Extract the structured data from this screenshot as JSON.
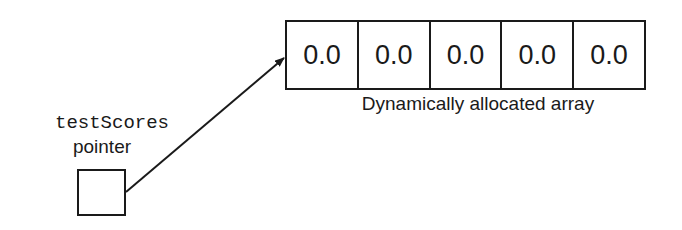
{
  "diagram": {
    "array": {
      "cells": [
        "0.0",
        "0.0",
        "0.0",
        "0.0",
        "0.0"
      ],
      "caption": "Dynamically allocated array"
    },
    "pointer": {
      "variable_name": "testScores",
      "label": "pointer"
    },
    "colors": {
      "stroke": "#1a1a1a",
      "background": "#ffffff"
    }
  }
}
